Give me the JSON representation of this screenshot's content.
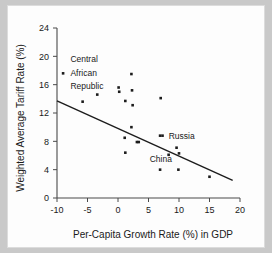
{
  "chart_data": {
    "type": "scatter",
    "title": "",
    "xlabel": "Per-Capita Growth Rate (%) in GDP",
    "ylabel": "Weighted Average Tariff Rate (%)",
    "xlim": [
      -10,
      20
    ],
    "ylim": [
      0,
      24
    ],
    "xticks": [
      -10,
      -5,
      0,
      5,
      10,
      15,
      20
    ],
    "xtick_labels": [
      "-10",
      "-5",
      "0",
      "5",
      "10",
      "15",
      "20"
    ],
    "yticks": [
      0,
      4,
      8,
      12,
      16,
      20,
      24
    ],
    "ytick_labels": [
      "0",
      "4",
      "8",
      "12",
      "16",
      "20",
      "24"
    ],
    "grid": false,
    "legend": "none",
    "marker": "square",
    "marker_color": "#1c1c1c",
    "points": [
      {
        "x": -9.0,
        "y": 17.6,
        "label": "Central African Republic"
      },
      {
        "x": -5.8,
        "y": 13.6,
        "label": ""
      },
      {
        "x": -3.4,
        "y": 14.6,
        "label": ""
      },
      {
        "x": 0.1,
        "y": 15.6,
        "label": ""
      },
      {
        "x": 0.2,
        "y": 15.0,
        "label": ""
      },
      {
        "x": 1.2,
        "y": 13.7,
        "label": ""
      },
      {
        "x": 2.2,
        "y": 17.5,
        "label": ""
      },
      {
        "x": 2.3,
        "y": 15.2,
        "label": ""
      },
      {
        "x": 2.4,
        "y": 13.1,
        "label": ""
      },
      {
        "x": 7.0,
        "y": 14.1,
        "label": ""
      },
      {
        "x": 2.2,
        "y": 10.0,
        "label": ""
      },
      {
        "x": 1.1,
        "y": 8.5,
        "label": ""
      },
      {
        "x": 3.1,
        "y": 7.9,
        "label": ""
      },
      {
        "x": 3.4,
        "y": 7.9,
        "label": ""
      },
      {
        "x": 1.2,
        "y": 6.4,
        "label": ""
      },
      {
        "x": 6.9,
        "y": 8.8,
        "label": ""
      },
      {
        "x": 7.3,
        "y": 8.8,
        "label": "Russia"
      },
      {
        "x": 9.6,
        "y": 7.1,
        "label": ""
      },
      {
        "x": 8.3,
        "y": 6.1,
        "label": "China"
      },
      {
        "x": 10.0,
        "y": 6.3,
        "label": ""
      },
      {
        "x": 6.9,
        "y": 4.0,
        "label": ""
      },
      {
        "x": 9.9,
        "y": 4.0,
        "label": ""
      },
      {
        "x": 15.0,
        "y": 3.0,
        "label": ""
      }
    ],
    "fit_line": {
      "x_start": -10,
      "y_start": 13.7,
      "x_end": 18.8,
      "y_end": 2.5
    },
    "annotations": [
      {
        "text": "Central",
        "x": -7.8,
        "y": 19.6
      },
      {
        "text": "African",
        "x": -7.8,
        "y": 17.6
      },
      {
        "text": "Republic",
        "x": -7.8,
        "y": 15.8
      },
      {
        "text": "Russia",
        "x": 8.3,
        "y": 8.8
      },
      {
        "text": "China",
        "x": 5.2,
        "y": 5.5
      }
    ]
  }
}
